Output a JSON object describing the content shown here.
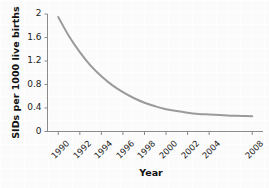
{
  "chart_data": {
    "type": "line",
    "title": "",
    "xlabel": "Year",
    "ylabel": "SIDs per 1000 live births",
    "xlim": [
      1989,
      2009
    ],
    "ylim": [
      0,
      2
    ],
    "grid": true,
    "legend": "none",
    "line_color": "#9a9a9a",
    "background_color": "#fbfbfb",
    "axis_color": "#808080",
    "x_tick_labels": [
      "1990",
      "1992",
      "1994",
      "1996",
      "1998",
      "2000",
      "2002",
      "2004",
      "2008"
    ],
    "x_ticks": [
      1990,
      1992,
      1994,
      1996,
      1998,
      2000,
      2002,
      2004,
      2008
    ],
    "y_tick_labels": [
      "0",
      "0.4",
      "0.8",
      "1.2",
      "1.6",
      "2"
    ],
    "y_ticks": [
      0,
      0.4,
      0.8,
      1.2,
      1.6,
      2
    ],
    "x": [
      1990,
      1991,
      1992,
      1993,
      1994,
      1995,
      1996,
      1997,
      1998,
      1999,
      2000,
      2001,
      2002,
      2003,
      2004,
      2005,
      2006,
      2007,
      2008
    ],
    "values": [
      1.95,
      1.62,
      1.35,
      1.12,
      0.94,
      0.79,
      0.67,
      0.57,
      0.49,
      0.43,
      0.38,
      0.35,
      0.32,
      0.3,
      0.29,
      0.28,
      0.27,
      0.265,
      0.26
    ],
    "series": [
      {
        "name": "SIDs rate",
        "values": [
          1.95,
          1.62,
          1.35,
          1.12,
          0.94,
          0.79,
          0.67,
          0.57,
          0.49,
          0.43,
          0.38,
          0.35,
          0.32,
          0.3,
          0.29,
          0.28,
          0.27,
          0.265,
          0.26
        ]
      }
    ]
  }
}
